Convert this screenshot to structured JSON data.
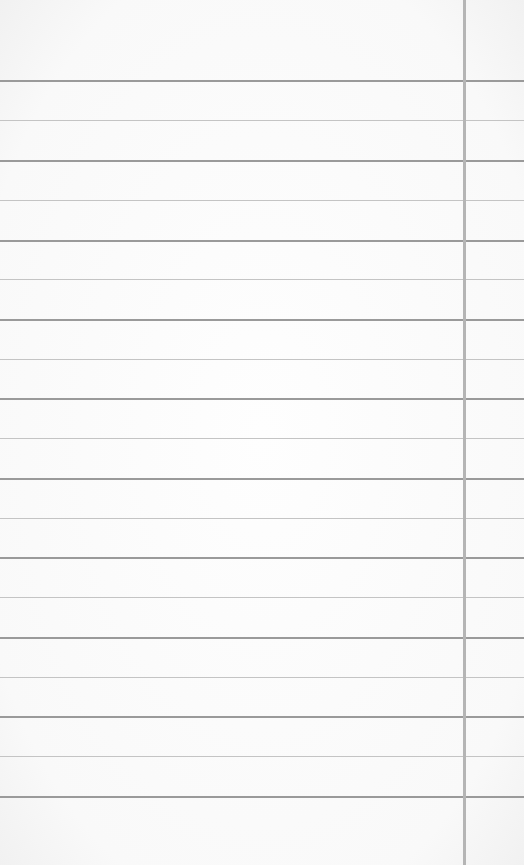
{
  "paper": {
    "type": "lined-notepaper",
    "background_color": "#fbfbfb",
    "rule_color_dark": "#9a9a9a",
    "rule_color_light": "#c4c4c4",
    "margin_line_color": "#b5b5b5",
    "margin_line_x": 463,
    "rules_y": [
      80,
      120,
      160,
      200,
      240,
      279,
      319,
      359,
      398,
      438,
      478,
      518,
      557,
      597,
      637,
      677,
      716,
      756,
      796
    ]
  }
}
